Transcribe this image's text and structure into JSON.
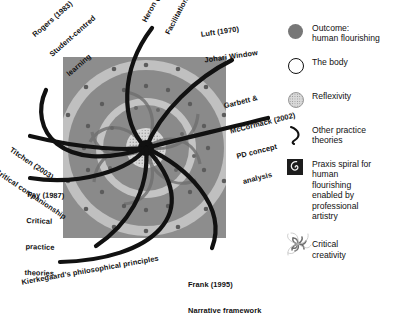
{
  "figure": {
    "colors": {
      "square_fill": "#8d8d8d",
      "ring_light": "#c3c3c3",
      "ring_mid": "#9e9e9e",
      "ring_dark": "#7b7b7b",
      "core": "#111111",
      "curve": "#111111",
      "background": "#ffffff"
    }
  },
  "practice_theories": [
    {
      "id": "rogers",
      "name": "rogers-label",
      "lines": [
        "Rogers (1983)",
        "Student-centred",
        "learning"
      ]
    },
    {
      "id": "heron",
      "name": "heron-label",
      "lines": [
        "Heron (2002)",
        "Facilitation"
      ]
    },
    {
      "id": "luft",
      "name": "luft-label",
      "lines": [
        "Luft (1970)",
        "Johari Window"
      ]
    },
    {
      "id": "garbett",
      "name": "garbett-mccormack-label",
      "lines": [
        "Garbett &",
        "McCormack (2002)",
        "PD concept",
        "analysis"
      ]
    },
    {
      "id": "titchen",
      "name": "titchen-label",
      "lines": [
        "Titchen (2003)",
        "Critical companionship"
      ]
    },
    {
      "id": "fay",
      "name": "fay-label",
      "lines": [
        "Fay (1987)",
        "Critical",
        "practice",
        "theories"
      ]
    },
    {
      "id": "kierkegaard",
      "name": "kierkegaard-label",
      "lines": [
        "Kierkegaard's philosophical principles"
      ]
    },
    {
      "id": "frank",
      "name": "frank-label",
      "lines": [
        "Frank (1995)",
        "Narrative framework"
      ]
    }
  ],
  "legend": {
    "items": [
      {
        "icon": "filled-circle-icon",
        "text": "Outcome:\nhuman flourishing"
      },
      {
        "icon": "open-circle-icon",
        "text": "The body"
      },
      {
        "icon": "dotted-circle-icon",
        "text": "Reflexivity"
      },
      {
        "icon": "curved-line-icon",
        "text": "Other practice\ntheories"
      },
      {
        "icon": "praxis-spiral-icon",
        "text": "Praxis spiral for\nhuman\nflourishing\nenabled by\nprofessional\nartistry"
      },
      {
        "icon": "critical-creativity-icon",
        "text": "Critical\ncreativity"
      }
    ]
  }
}
